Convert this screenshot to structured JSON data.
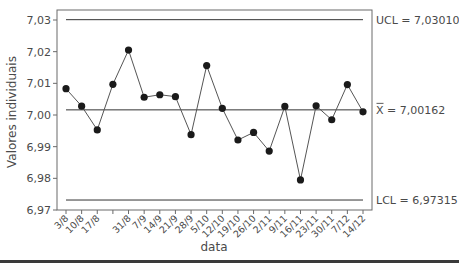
{
  "chart_data": {
    "type": "line",
    "subtype": "individuals-control-chart",
    "title": "",
    "xlabel": "data",
    "ylabel": "Valores individuais",
    "ylim": [
      6.97,
      7.03
    ],
    "yticks": [
      7.03,
      7.02,
      7.01,
      7.0,
      6.99,
      6.98,
      6.97
    ],
    "ytick_labels": [
      "7,03",
      "7,02",
      "7,01",
      "7,00",
      "6,99",
      "6,98",
      "6,97"
    ],
    "grid": false,
    "categories": [
      "3/8",
      "10/8",
      "17/8",
      "24/8",
      "31/8",
      "7/9",
      "14/9",
      "21/9",
      "28/9",
      "5/10",
      "12/10",
      "19/10",
      "26/10",
      "2/11",
      "9/11",
      "16/11",
      "23/11",
      "30/11",
      "7/12",
      "14/12"
    ],
    "xtick_labels": [
      "3/8",
      "10/8",
      "17/8",
      "",
      "31/8",
      "7/9",
      "14/9",
      "21/9",
      "28/9",
      "5/10",
      "12/10",
      "19/10",
      "26/10",
      "2/11",
      "9/11",
      "16/11",
      "23/11",
      "30/11",
      "7/12",
      "14/12"
    ],
    "series": [
      {
        "name": "Valores individuais",
        "values": [
          7.0083,
          7.0028,
          6.9953,
          7.0097,
          7.0205,
          7.0056,
          7.0064,
          7.0058,
          6.9938,
          7.0156,
          7.0021,
          6.9921,
          6.9945,
          6.9886,
          7.0027,
          6.9795,
          7.0029,
          6.9985,
          7.0096,
          7.001
        ],
        "color": "#1a1a1a",
        "marker": "circle"
      }
    ],
    "control_lines": [
      {
        "name": "UCL",
        "value": 7.0301,
        "label": "UCL = 7,03010"
      },
      {
        "name": "mean",
        "value": 7.00162,
        "label": "X = 7,00162",
        "symbol": "X-bar"
      },
      {
        "name": "LCL",
        "value": 6.97315,
        "label": "LCL = 6,97315"
      }
    ],
    "colors": {
      "line": "#555555",
      "marker": "#1a1a1a",
      "control_line": "#333333",
      "axis": "#555555",
      "text": "#4a4a4a"
    }
  }
}
